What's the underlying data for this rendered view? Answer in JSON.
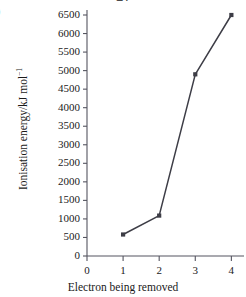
{
  "figure": {
    "part_label": ")",
    "clipped_title": "gy"
  },
  "chart_data": {
    "type": "line",
    "title": "",
    "xlabel": "Electron being removed",
    "ylabel": "Ionisation energy/kJ mol",
    "ylabel_superscript": "−1",
    "x": [
      1,
      2,
      3,
      4
    ],
    "values": [
      580,
      1090,
      4900,
      6500
    ],
    "series": [
      {
        "name": "Ionisation energy",
        "x": [
          1,
          2,
          3,
          4
        ],
        "values": [
          580,
          1090,
          4900,
          6500
        ]
      }
    ],
    "xlim": [
      0,
      4.35
    ],
    "ylim": [
      0,
      6500
    ],
    "xticks": [
      "0",
      "1",
      "2",
      "3",
      "4"
    ],
    "xtick_values": [
      0,
      1,
      2,
      3,
      4
    ],
    "yticks": [
      "0",
      "500",
      "1000",
      "1500",
      "2000",
      "2500",
      "3000",
      "3500",
      "4000",
      "4500",
      "5000",
      "5500",
      "6000",
      "6500"
    ],
    "ytick_values": [
      0,
      500,
      1000,
      1500,
      2000,
      2500,
      3000,
      3500,
      4000,
      4500,
      5000,
      5500,
      6000,
      6500
    ],
    "grid": false,
    "legend": null,
    "marker": "square",
    "line_color": "#3d3d46",
    "marker_color": "#3d3d46",
    "axis_color": "#555560",
    "background": "#ffffff"
  }
}
